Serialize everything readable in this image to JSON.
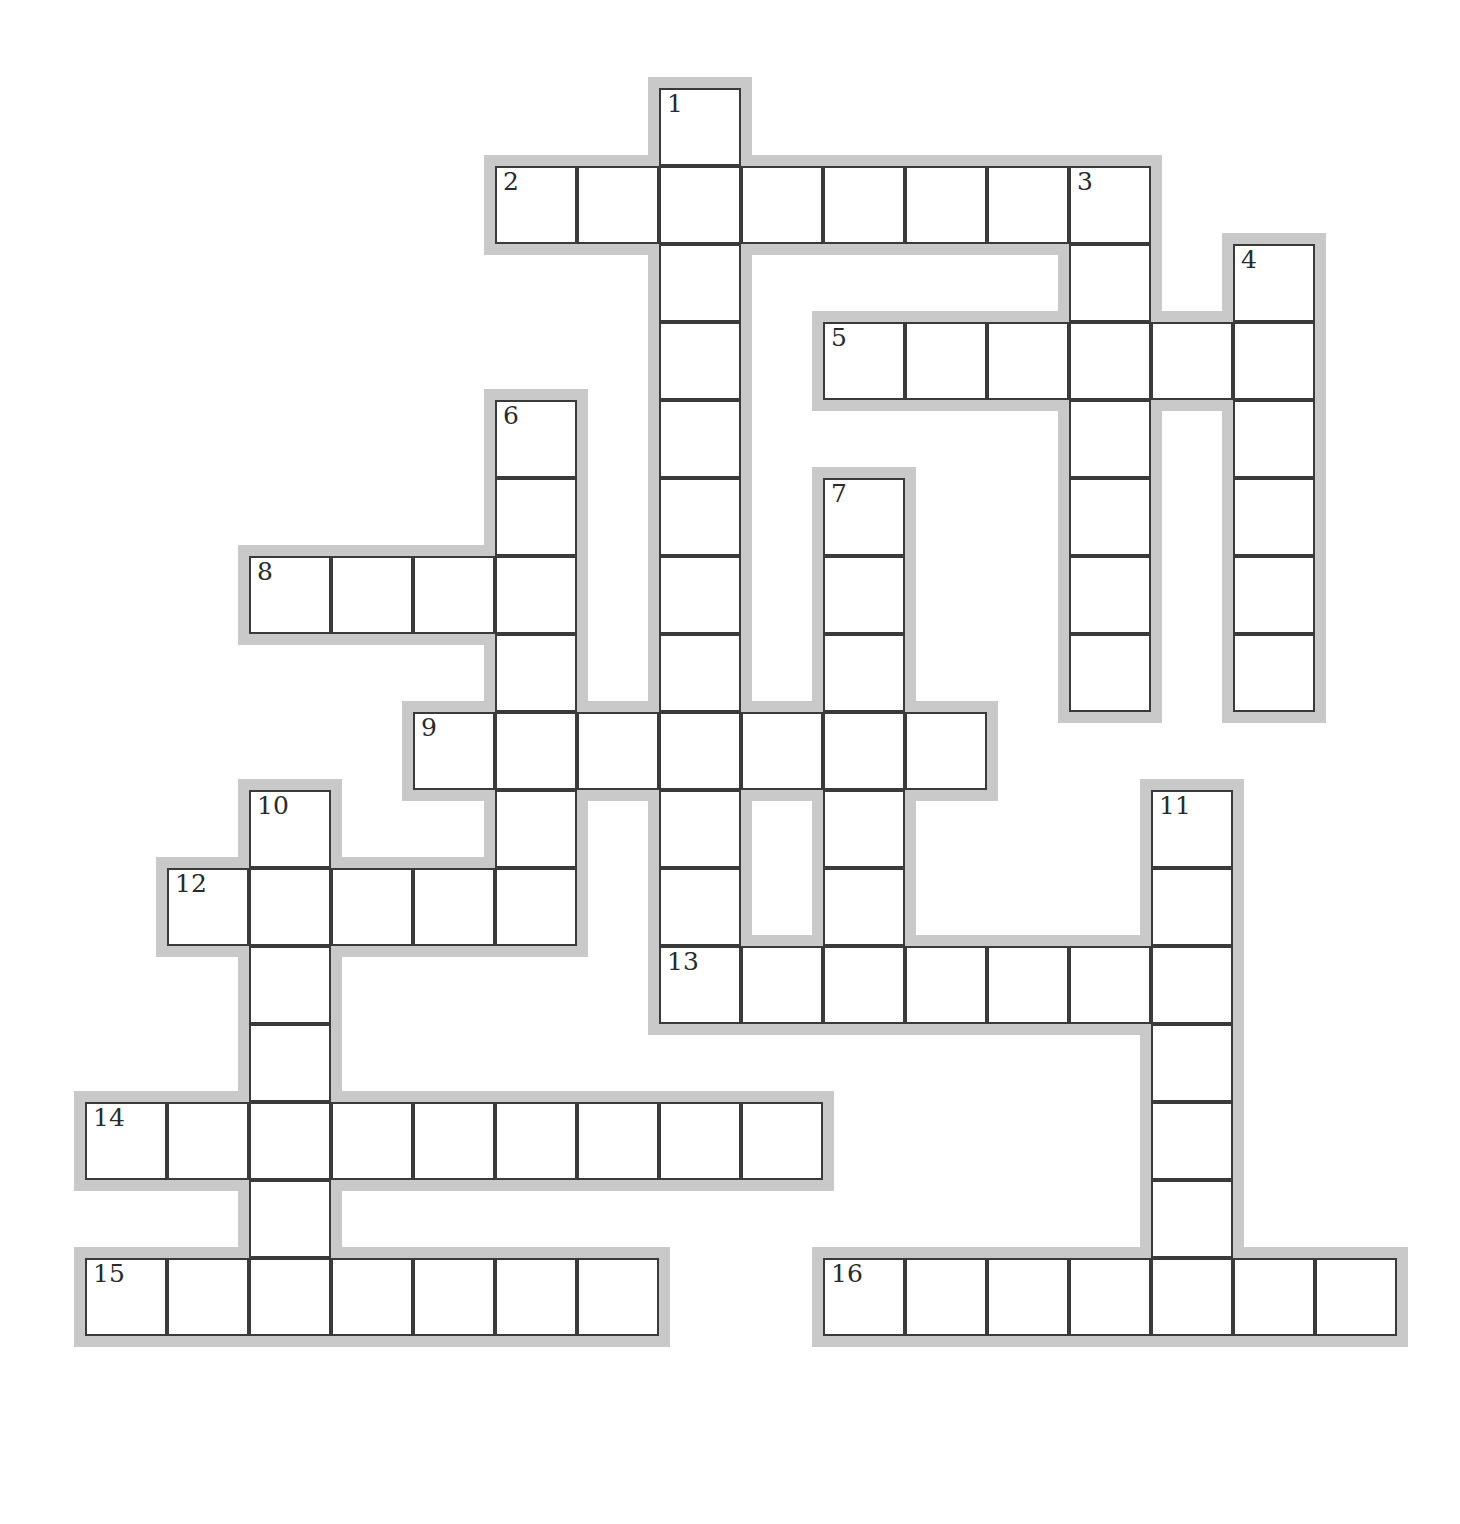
{
  "puzzle": {
    "title": "Crossword Puzzle Grid",
    "type": "empty-crossword-grid",
    "width": 1460,
    "height": 1524,
    "cell_size": 82,
    "cell_height": 78,
    "origin_x": 85,
    "origin_y": 88,
    "colors": {
      "background": "#ffffff",
      "cell_fill": "#ffffff",
      "cell_border": "#3a3a3a",
      "halo": "#c9c9c9",
      "number_text": "#2a2a2a"
    },
    "numbered_clue_count": 16,
    "total_cells": 104
  },
  "entries": [
    {
      "number": 1,
      "direction": "down",
      "col": 7,
      "row": 0,
      "length": 11,
      "label": "1"
    },
    {
      "number": 2,
      "direction": "across",
      "col": 5,
      "row": 1,
      "length": 8,
      "label": "2"
    },
    {
      "number": 3,
      "direction": "down",
      "col": 12,
      "row": 1,
      "length": 7,
      "label": "3"
    },
    {
      "number": 4,
      "direction": "down",
      "col": 14,
      "row": 2,
      "length": 6,
      "label": "4"
    },
    {
      "number": 5,
      "direction": "across",
      "col": 9,
      "row": 3,
      "length": 6,
      "label": "5"
    },
    {
      "number": 6,
      "direction": "down",
      "col": 5,
      "row": 4,
      "length": 8,
      "label": "6"
    },
    {
      "number": 7,
      "direction": "down",
      "col": 9,
      "row": 5,
      "length": 7,
      "label": "7"
    },
    {
      "number": 8,
      "direction": "across",
      "col": 2,
      "row": 6,
      "length": 4,
      "label": "8"
    },
    {
      "number": 9,
      "direction": "across",
      "col": 4,
      "row": 8,
      "length": 7,
      "label": "9"
    },
    {
      "number": 10,
      "direction": "down",
      "col": 2,
      "row": 9,
      "length": 7,
      "label": "10"
    },
    {
      "number": 11,
      "direction": "down",
      "col": 13,
      "row": 9,
      "length": 7,
      "label": "11"
    },
    {
      "number": 12,
      "direction": "across",
      "col": 1,
      "row": 10,
      "length": 5,
      "label": "12"
    },
    {
      "number": 13,
      "direction": "across",
      "col": 7,
      "row": 11,
      "length": 7,
      "label": "13"
    },
    {
      "number": 14,
      "direction": "across",
      "col": 0,
      "row": 13,
      "length": 9,
      "label": "14"
    },
    {
      "number": 15,
      "direction": "across",
      "col": 0,
      "row": 15,
      "length": 7,
      "label": "15"
    },
    {
      "number": 16,
      "direction": "across",
      "col": 9,
      "row": 15,
      "length": 7,
      "label": "16"
    }
  ],
  "cells": [
    {
      "col": 7,
      "row": 0,
      "number": "1"
    },
    {
      "col": 5,
      "row": 1,
      "number": "2"
    },
    {
      "col": 6,
      "row": 1,
      "number": ""
    },
    {
      "col": 7,
      "row": 1,
      "number": ""
    },
    {
      "col": 8,
      "row": 1,
      "number": ""
    },
    {
      "col": 9,
      "row": 1,
      "number": ""
    },
    {
      "col": 10,
      "row": 1,
      "number": ""
    },
    {
      "col": 11,
      "row": 1,
      "number": ""
    },
    {
      "col": 12,
      "row": 1,
      "number": "3"
    },
    {
      "col": 7,
      "row": 2,
      "number": ""
    },
    {
      "col": 12,
      "row": 2,
      "number": ""
    },
    {
      "col": 14,
      "row": 2,
      "number": "4"
    },
    {
      "col": 7,
      "row": 3,
      "number": ""
    },
    {
      "col": 9,
      "row": 3,
      "number": "5"
    },
    {
      "col": 10,
      "row": 3,
      "number": ""
    },
    {
      "col": 11,
      "row": 3,
      "number": ""
    },
    {
      "col": 12,
      "row": 3,
      "number": ""
    },
    {
      "col": 13,
      "row": 3,
      "number": ""
    },
    {
      "col": 14,
      "row": 3,
      "number": ""
    },
    {
      "col": 5,
      "row": 4,
      "number": "6"
    },
    {
      "col": 7,
      "row": 4,
      "number": ""
    },
    {
      "col": 12,
      "row": 4,
      "number": ""
    },
    {
      "col": 14,
      "row": 4,
      "number": ""
    },
    {
      "col": 5,
      "row": 5,
      "number": ""
    },
    {
      "col": 7,
      "row": 5,
      "number": ""
    },
    {
      "col": 9,
      "row": 5,
      "number": "7"
    },
    {
      "col": 12,
      "row": 5,
      "number": ""
    },
    {
      "col": 14,
      "row": 5,
      "number": ""
    },
    {
      "col": 2,
      "row": 6,
      "number": "8"
    },
    {
      "col": 3,
      "row": 6,
      "number": ""
    },
    {
      "col": 4,
      "row": 6,
      "number": ""
    },
    {
      "col": 5,
      "row": 6,
      "number": ""
    },
    {
      "col": 7,
      "row": 6,
      "number": ""
    },
    {
      "col": 9,
      "row": 6,
      "number": ""
    },
    {
      "col": 12,
      "row": 6,
      "number": ""
    },
    {
      "col": 14,
      "row": 6,
      "number": ""
    },
    {
      "col": 5,
      "row": 7,
      "number": ""
    },
    {
      "col": 7,
      "row": 7,
      "number": ""
    },
    {
      "col": 9,
      "row": 7,
      "number": ""
    },
    {
      "col": 12,
      "row": 7,
      "number": ""
    },
    {
      "col": 14,
      "row": 7,
      "number": ""
    },
    {
      "col": 4,
      "row": 8,
      "number": "9"
    },
    {
      "col": 5,
      "row": 8,
      "number": ""
    },
    {
      "col": 6,
      "row": 8,
      "number": ""
    },
    {
      "col": 7,
      "row": 8,
      "number": ""
    },
    {
      "col": 8,
      "row": 8,
      "number": ""
    },
    {
      "col": 9,
      "row": 8,
      "number": ""
    },
    {
      "col": 10,
      "row": 8,
      "number": ""
    },
    {
      "col": 2,
      "row": 9,
      "number": "10"
    },
    {
      "col": 5,
      "row": 9,
      "number": ""
    },
    {
      "col": 7,
      "row": 9,
      "number": ""
    },
    {
      "col": 9,
      "row": 9,
      "number": ""
    },
    {
      "col": 13,
      "row": 9,
      "number": "11"
    },
    {
      "col": 1,
      "row": 10,
      "number": "12"
    },
    {
      "col": 2,
      "row": 10,
      "number": ""
    },
    {
      "col": 3,
      "row": 10,
      "number": ""
    },
    {
      "col": 4,
      "row": 10,
      "number": ""
    },
    {
      "col": 5,
      "row": 10,
      "number": ""
    },
    {
      "col": 7,
      "row": 10,
      "number": ""
    },
    {
      "col": 9,
      "row": 10,
      "number": ""
    },
    {
      "col": 13,
      "row": 10,
      "number": ""
    },
    {
      "col": 2,
      "row": 11,
      "number": ""
    },
    {
      "col": 7,
      "row": 11,
      "number": "13"
    },
    {
      "col": 8,
      "row": 11,
      "number": ""
    },
    {
      "col": 9,
      "row": 11,
      "number": ""
    },
    {
      "col": 10,
      "row": 11,
      "number": ""
    },
    {
      "col": 11,
      "row": 11,
      "number": ""
    },
    {
      "col": 12,
      "row": 11,
      "number": ""
    },
    {
      "col": 13,
      "row": 11,
      "number": ""
    },
    {
      "col": 2,
      "row": 12,
      "number": ""
    },
    {
      "col": 13,
      "row": 12,
      "number": ""
    },
    {
      "col": 0,
      "row": 13,
      "number": "14"
    },
    {
      "col": 1,
      "row": 13,
      "number": ""
    },
    {
      "col": 2,
      "row": 13,
      "number": ""
    },
    {
      "col": 3,
      "row": 13,
      "number": ""
    },
    {
      "col": 4,
      "row": 13,
      "number": ""
    },
    {
      "col": 5,
      "row": 13,
      "number": ""
    },
    {
      "col": 6,
      "row": 13,
      "number": ""
    },
    {
      "col": 7,
      "row": 13,
      "number": ""
    },
    {
      "col": 8,
      "row": 13,
      "number": ""
    },
    {
      "col": 13,
      "row": 13,
      "number": ""
    },
    {
      "col": 2,
      "row": 14,
      "number": ""
    },
    {
      "col": 13,
      "row": 14,
      "number": ""
    },
    {
      "col": 0,
      "row": 15,
      "number": "15"
    },
    {
      "col": 1,
      "row": 15,
      "number": ""
    },
    {
      "col": 2,
      "row": 15,
      "number": ""
    },
    {
      "col": 3,
      "row": 15,
      "number": ""
    },
    {
      "col": 4,
      "row": 15,
      "number": ""
    },
    {
      "col": 5,
      "row": 15,
      "number": ""
    },
    {
      "col": 6,
      "row": 15,
      "number": ""
    },
    {
      "col": 9,
      "row": 15,
      "number": "16"
    },
    {
      "col": 10,
      "row": 15,
      "number": ""
    },
    {
      "col": 11,
      "row": 15,
      "number": ""
    },
    {
      "col": 12,
      "row": 15,
      "number": ""
    },
    {
      "col": 13,
      "row": 15,
      "number": ""
    },
    {
      "col": 14,
      "row": 15,
      "number": ""
    },
    {
      "col": 15,
      "row": 15,
      "number": ""
    }
  ]
}
